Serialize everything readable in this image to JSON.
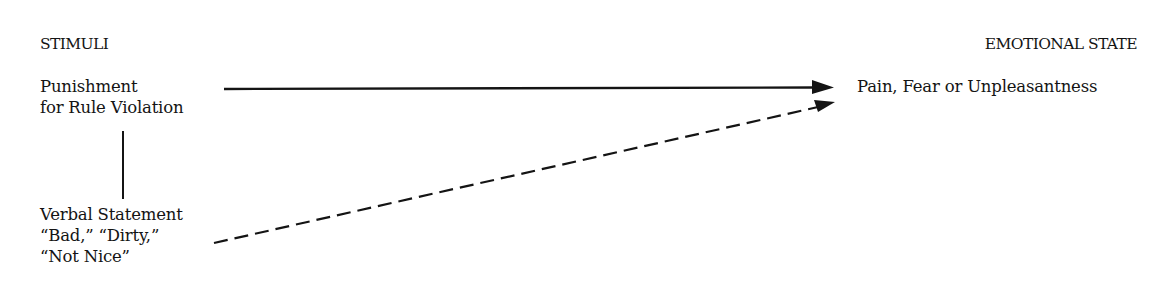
{
  "diagram": {
    "left_header": "STIMULI",
    "right_header": "EMOTIONAL STATE",
    "stimulus_primary": {
      "line1": "Punishment",
      "line2": "for Rule Violation"
    },
    "stimulus_secondary": {
      "line1": "Verbal Statement",
      "line2": "“Bad,” “Dirty,”",
      "line3": "“Not Nice”"
    },
    "response": "Pain, Fear or Unpleasantness",
    "connections": [
      {
        "from": "Punishment for Rule Violation",
        "to": "Pain, Fear or Unpleasantness",
        "style": "solid-arrow"
      },
      {
        "from": "Verbal Statement “Bad,” “Dirty,” “Not Nice”",
        "to": "Pain, Fear or Unpleasantness",
        "style": "dashed-arrow"
      },
      {
        "from": "Punishment for Rule Violation",
        "to": "Verbal Statement “Bad,” “Dirty,” “Not Nice”",
        "style": "solid-line"
      }
    ]
  }
}
